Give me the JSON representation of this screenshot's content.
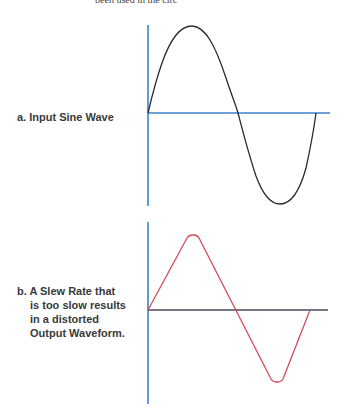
{
  "header_fragment": "been used in the circ",
  "panel_a": {
    "label": "a. Input Sine Wave",
    "waveform": "sine",
    "trace_color": "#2b2b2b",
    "axis_color": "#3b82c8"
  },
  "panel_b": {
    "label_lines": [
      "b. A Slew Rate that",
      "is too slow results",
      "in a distorted",
      "Output Waveform."
    ],
    "waveform": "slew-limited (trapezoidal/triangular)",
    "trace_color": "#d94a5a",
    "axis_color": "#3b82c8",
    "baseline_color": "#4a4a4a"
  },
  "colors": {
    "background": "#ffffff",
    "axis_blue": "#3b82c8",
    "sine_black": "#2b2b2b",
    "slew_red": "#d94a5a",
    "text": "#3a3a3a"
  }
}
